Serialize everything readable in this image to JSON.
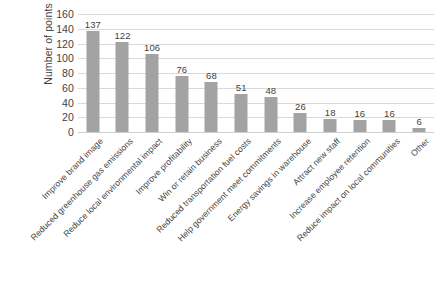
{
  "chart_data": {
    "type": "bar",
    "title": "",
    "subtitle": "",
    "xlabel": "",
    "ylabel": "Number of points",
    "ylim": [
      0,
      160
    ],
    "ytick_step": 20,
    "yticks": [
      160,
      140,
      120,
      100,
      80,
      60,
      40,
      20,
      0
    ],
    "grid": true,
    "legend": false,
    "legend_position": "none",
    "bar_color": "#a3a3a3",
    "gridline_color": "#d9d9d9",
    "text_color": "#3f3f3f",
    "categories": [
      "Improve brand image",
      "Reduced greenhouse gas emissions",
      "Reduce local environmental impact",
      "Improve profitability",
      "Win or retain business",
      "Reduced transportation fuel costs",
      "Help government meet commitments",
      "Energy savings in warehouse",
      "Attract new staff",
      "Increase employee retention",
      "Reduce impact on local communities",
      "Other"
    ],
    "values": [
      137,
      122,
      106,
      76,
      68,
      51,
      48,
      26,
      18,
      16,
      16,
      6
    ],
    "data_labels": [
      "137",
      "122",
      "106",
      "76",
      "68",
      "51",
      "48",
      "26",
      "18",
      "16",
      "16",
      "6"
    ]
  }
}
